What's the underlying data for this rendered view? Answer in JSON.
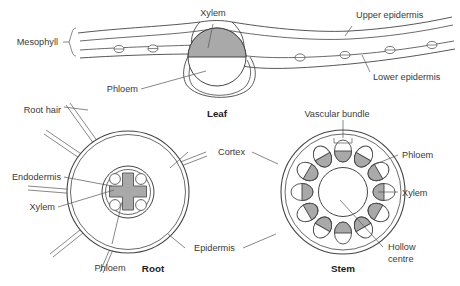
{
  "figure": {
    "title_hidden": "",
    "gray_fill": "#a9a9a9",
    "stroke": "#444444",
    "text_color": "#3a3a3a"
  },
  "leaf": {
    "title": "Leaf",
    "labels": {
      "mesophyll": "Mesophyll",
      "xylem": "Xylem",
      "phloem": "Phloem",
      "upper_epidermis": "Upper epidermis",
      "lower_epidermis": "Lower epidermis"
    },
    "stomata_count": 6
  },
  "root": {
    "title": "Root",
    "labels": {
      "root_hair": "Root hair",
      "endodermis": "Endodermis",
      "xylem": "Xylem",
      "phloem": "Phloem",
      "cortex": "Cortex",
      "epidermis": "Epidermis"
    },
    "phloem_circles": 4,
    "root_hairs": 6
  },
  "stem": {
    "title": "Stem",
    "labels": {
      "vascular_bundle": "Vascular bundle",
      "phloem": "Phloem",
      "xylem": "Xylem",
      "hollow_centre_line1": "Hollow",
      "hollow_centre_line2": "centre",
      "cortex": "Cortex",
      "epidermis": "Epidermis"
    },
    "bundle_count": 12
  }
}
